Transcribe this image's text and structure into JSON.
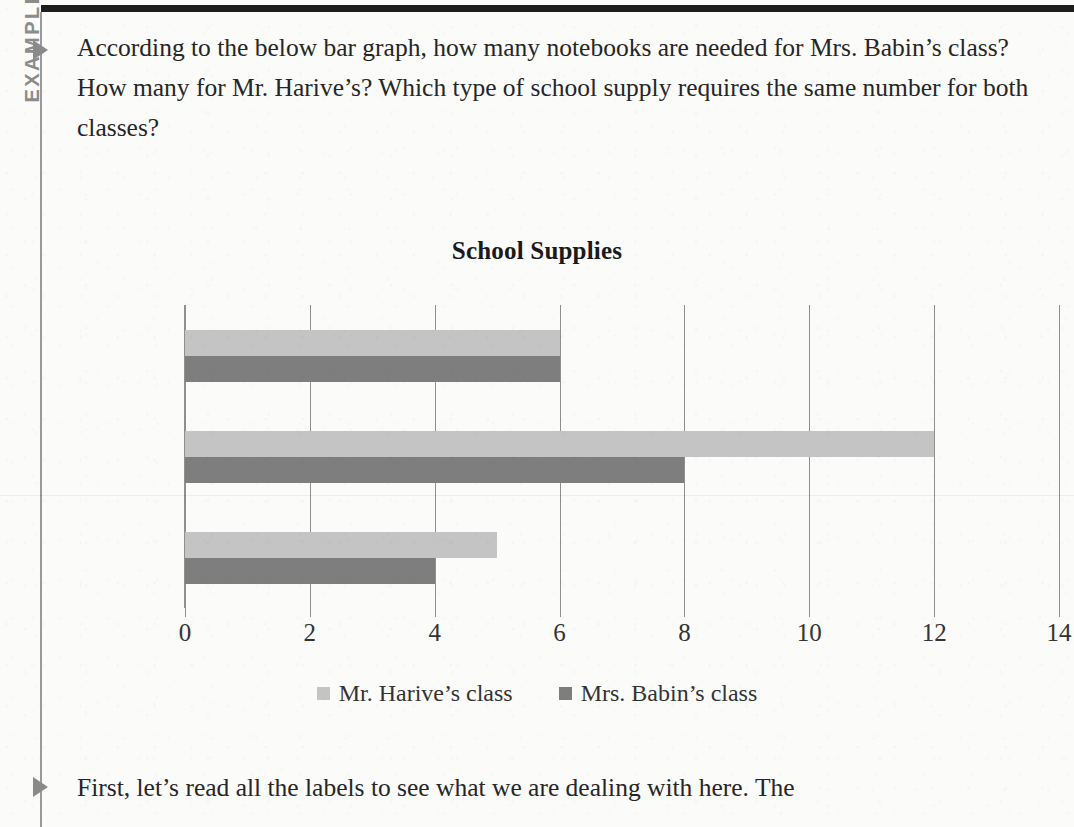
{
  "sidebar": {
    "tab_label": "EXAMPLE"
  },
  "body": {
    "intro_paragraph": "According to the below bar graph, how many notebooks are needed for Mrs. Babin’s class? How many for Mr. Harive’s? Which type of school supply requires the same number for both classes?",
    "after_paragraph": "First, let’s read all the labels to see what we are dealing with here. The"
  },
  "colors": {
    "light_series": "#c4c4c4",
    "dark_series": "#7e7e7e",
    "axis": "#8f8f8f",
    "rule": "#1d1d1d",
    "tab_text": "#8c8c8c"
  },
  "chart_data": {
    "type": "bar",
    "orientation": "horizontal",
    "title": "School Supplies",
    "xlabel": "",
    "ylabel": "",
    "categories": [
      "Folders",
      "Pencils",
      "Notebooks"
    ],
    "series": [
      {
        "name": "Mr. Harive’s class",
        "color": "#c4c4c4",
        "values": [
          6,
          12,
          5
        ]
      },
      {
        "name": "Mrs. Babin’s class",
        "color": "#7e7e7e",
        "values": [
          6,
          8,
          4
        ]
      }
    ],
    "xticks": [
      0,
      2,
      4,
      6,
      8,
      10,
      12,
      14
    ],
    "xlim": [
      0,
      14
    ],
    "grid": true,
    "legend_position": "bottom"
  }
}
